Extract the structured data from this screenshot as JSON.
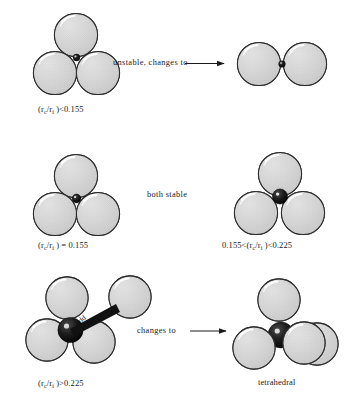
{
  "figure": {
    "sphere_fill": "#d4d4d4",
    "sphere_stroke": "#2b2b2b",
    "cation_fill": "#141414",
    "highlight": "#ffffff",
    "background": "#ffffff"
  },
  "rows": [
    {
      "id": "row-1",
      "left": {
        "label": "(rᴄ/rᵢ )<0.155",
        "ratio_symbol": "(r",
        "sub_c": "c",
        "mid_symbol": "/r",
        "sub_i": "i",
        "relation": " )<0.155",
        "arrangement": "triangular",
        "coordination_number": 3,
        "outer_spheres": 3,
        "center_particle": "cation-too-small",
        "state": "unstable"
      },
      "middle": {
        "text": "unstable, changes to",
        "arrow": "⟶"
      },
      "right": {
        "arrangement": "linear-pair",
        "outer_spheres": 2,
        "center_particle": "cation",
        "label": ""
      }
    },
    {
      "id": "row-2",
      "left": {
        "label": "(rᴄ/rᵢ ) = 0.155",
        "arrangement": "triangular",
        "coordination_number": 3,
        "outer_spheres": 3,
        "center_particle": "cation-exact-fit",
        "state": "stable"
      },
      "middle": {
        "text": "both stable",
        "arrow": ""
      },
      "right": {
        "label": "0.155<(rᴄ/rᵢ )<0.225",
        "arrangement": "triangular",
        "coordination_number": 3,
        "outer_spheres": 3,
        "center_particle": "cation-larger",
        "state": "stable"
      }
    },
    {
      "id": "row-3",
      "left": {
        "label": "(rᴄ/rᵢ )>0.225",
        "arrangement": "triangular-with-addition",
        "coordination_number": 3,
        "outer_spheres": 4,
        "center_particle": "cation-large",
        "wedge_label": "add",
        "state": "converts"
      },
      "middle": {
        "text": "changes to",
        "arrow": "⟶"
      },
      "right": {
        "label": "tetrahedral",
        "arrangement": "tetrahedral",
        "coordination_number": 4,
        "outer_spheres": 4,
        "center_particle": "cation-large",
        "state": "stable"
      }
    }
  ],
  "captions": {
    "r1_left": "(r",
    "r1_left_sub1": "c",
    "r1_left_mid": "/r",
    "r1_left_sub2": "i",
    "r1_left_tail": " )<0.155",
    "r2_left_tail": " ) = 0.155",
    "r2_right_head": "0.155<(r",
    "r2_right_tail": " )<0.225",
    "r3_left_tail": " )>0.225",
    "r3_right": "tetrahedral"
  },
  "middle_texts": {
    "row1": "unstable, changes to",
    "row2": "both stable",
    "row3": "changes to"
  },
  "wedge": {
    "label": "add"
  }
}
